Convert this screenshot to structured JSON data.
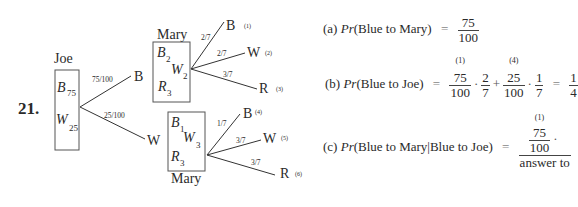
{
  "problem_number": "21.",
  "tree": {
    "joe": {
      "label": "Joe",
      "contents": [
        {
          "letter": "B",
          "count": "75"
        },
        {
          "letter": "W",
          "count": "25"
        }
      ],
      "branches": [
        {
          "prob": "75/100",
          "outcome": "B"
        },
        {
          "prob": "25/100",
          "outcome": "W"
        }
      ]
    },
    "mary_upper": {
      "label": "Mary",
      "contents": [
        {
          "letter": "B",
          "count": "2"
        },
        {
          "letter": "W",
          "count": "2"
        },
        {
          "letter": "R",
          "count": "3"
        }
      ],
      "branches": [
        {
          "prob": "2/7",
          "outcome": "B",
          "tag": "(1)"
        },
        {
          "prob": "2/7",
          "outcome": "W",
          "tag": "(2)"
        },
        {
          "prob": "3/7",
          "outcome": "R",
          "tag": "(3)"
        }
      ]
    },
    "mary_lower": {
      "label": "Mary",
      "contents": [
        {
          "letter": "B",
          "count": "1"
        },
        {
          "letter": "W",
          "count": "3"
        },
        {
          "letter": "R",
          "count": "3"
        }
      ],
      "branches": [
        {
          "prob": "1/7",
          "outcome": "B",
          "tag": "(4)"
        },
        {
          "prob": "3/7",
          "outcome": "W",
          "tag": "(5)"
        },
        {
          "prob": "3/7",
          "outcome": "R",
          "tag": "(6)"
        }
      ]
    }
  },
  "equations": {
    "a": {
      "label": "(a)",
      "pr": "Pr",
      "event": "(Blue to Mary)",
      "eq": "=",
      "result": {
        "num": "75",
        "den": "100"
      }
    },
    "b": {
      "label": "(b)",
      "pr": "Pr",
      "event": "(Blue to Joe)",
      "eq": "=",
      "term1": {
        "num": "75",
        "den": "100",
        "tag": "(1)",
        "factor": {
          "num": "2",
          "den": "7"
        }
      },
      "plus": "+",
      "term2": {
        "num": "25",
        "den": "100",
        "tag": "(4)",
        "factor": {
          "num": "1",
          "den": "7"
        }
      },
      "dot": "·",
      "eq2": "=",
      "result": {
        "num": "1",
        "den": "4"
      }
    },
    "c": {
      "label": "(c)",
      "pr": "Pr",
      "event": "(Blue to Mary|Blue to Joe)",
      "eq": "=",
      "num_frac": {
        "num": "75",
        "den": "100",
        "tag": "(1)"
      },
      "dot": "·",
      "den_text": "answer to"
    }
  }
}
